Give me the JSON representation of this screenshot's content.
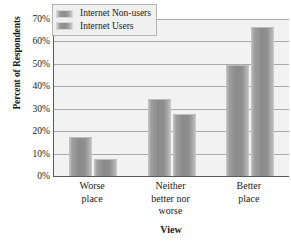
{
  "chart_data": {
    "type": "bar",
    "title": "",
    "xlabel": "View",
    "ylabel": "Percent of Respondents",
    "categories": [
      "Worse place",
      "Neither better nor worse",
      "Better place"
    ],
    "category_lines": [
      [
        "Worse",
        "place"
      ],
      [
        "Neither",
        "better nor",
        "worse"
      ],
      [
        "Better",
        "place"
      ]
    ],
    "series": [
      {
        "name": "Internet Non-users",
        "values": [
          17,
          34,
          49
        ]
      },
      {
        "name": "Internet Users",
        "values": [
          7,
          27,
          66
        ]
      }
    ],
    "ylim": [
      0,
      70
    ],
    "yticks": [
      0,
      10,
      20,
      30,
      40,
      50,
      60,
      70
    ],
    "ytick_labels": [
      "0%",
      "10%",
      "20%",
      "30%",
      "40%",
      "50%",
      "60%",
      "70%"
    ],
    "grid": true,
    "legend_position": "top-left",
    "colors": {
      "bar_fill": "#8f8f8f",
      "bar_highlight": "#c8c8c8",
      "plot_background": "#f2f2f2",
      "gridline": "#a9a9a9",
      "axis": "#5a5a5a",
      "text": "#1a1a1a",
      "legend_background": "#f0f0f0",
      "legend_border": "#b5b5b5"
    }
  }
}
